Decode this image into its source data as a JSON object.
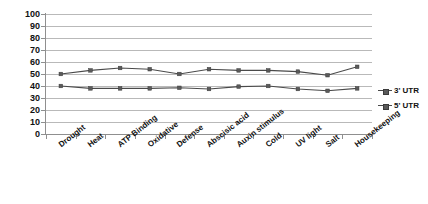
{
  "chart_data": {
    "type": "line",
    "title": "",
    "subtitle": "",
    "xlabel": "",
    "ylabel": "",
    "ylim": [
      0,
      100
    ],
    "ytick_step": 10,
    "yticks": [
      100,
      90,
      80,
      70,
      60,
      50,
      40,
      30,
      20,
      10,
      0
    ],
    "grid": true,
    "grid_axis": "y",
    "legend_position": "right",
    "categories": [
      "Drought",
      "Heat",
      "ATP Binding",
      "Oxidative",
      "Defense",
      "Abscisic acid",
      "Auxin stimulus",
      "Cold",
      "UV light",
      "Salt",
      "Housekeeping"
    ],
    "series": [
      {
        "name": "3' UTR",
        "color": "#4a4a4a",
        "marker": "square",
        "values": [
          50,
          53,
          55,
          54,
          50,
          54,
          53,
          53,
          52,
          49,
          56
        ]
      },
      {
        "name": "5' UTR",
        "color": "#4a4a4a",
        "marker": "square",
        "values": [
          40,
          38,
          38,
          38,
          38.5,
          37.5,
          39.5,
          40,
          37.5,
          36,
          38
        ]
      }
    ]
  },
  "legend": {
    "entries": [
      {
        "label": "3' UTR"
      },
      {
        "label": "5' UTR"
      }
    ]
  },
  "style": {
    "gridline_color": "#b9b9b9",
    "axis_color": "#8f8f8f",
    "line_color": "#4a4a4a",
    "marker_color": "#5a5a5a",
    "text_color": "#111111",
    "background": "#ffffff"
  }
}
